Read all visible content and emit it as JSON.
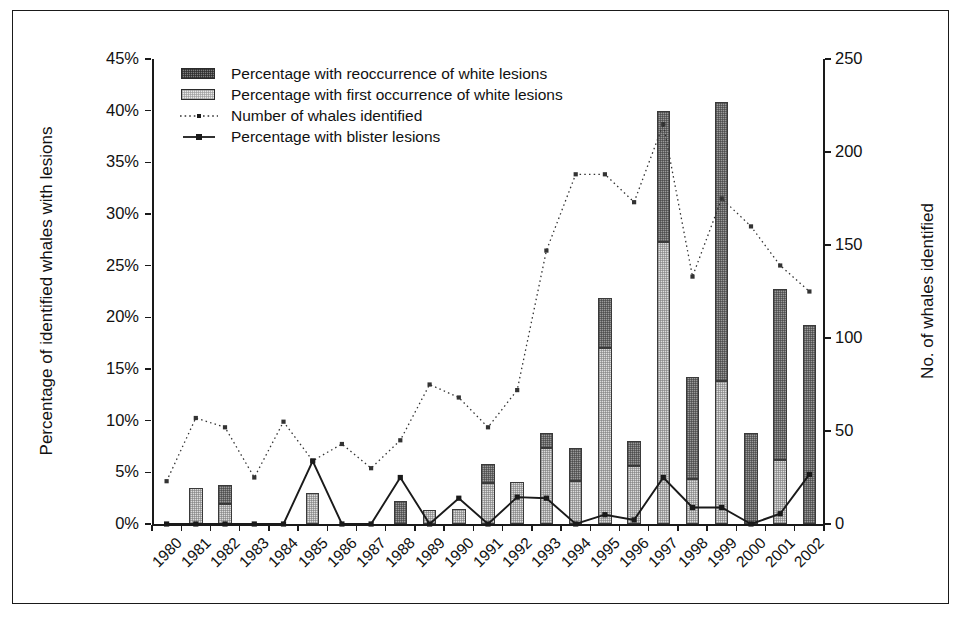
{
  "chart_data": {
    "type": "bar",
    "title": "",
    "subtitle": "",
    "xlabel": "",
    "ylabel": "Percentage of identified whales with lesions",
    "ylabel_right": "No. of whales identified",
    "ylim": [
      0,
      45
    ],
    "ylim_right": [
      0,
      250
    ],
    "ytick_labels": [
      "0%",
      "5%",
      "10%",
      "15%",
      "20%",
      "25%",
      "30%",
      "35%",
      "40%",
      "45%"
    ],
    "ytick_values": [
      0,
      5,
      10,
      15,
      20,
      25,
      30,
      35,
      40,
      45
    ],
    "ytick_labels_right": [
      "0",
      "50",
      "100",
      "150",
      "200",
      "250"
    ],
    "ytick_values_right": [
      0,
      50,
      100,
      150,
      200,
      250
    ],
    "grid": false,
    "legend_position": "top-left",
    "categories": [
      "1980",
      "1981",
      "1982",
      "1983",
      "1984",
      "1985",
      "1986",
      "1987",
      "1988",
      "1989",
      "1990",
      "1991",
      "1992",
      "1993",
      "1994",
      "1995",
      "1996",
      "1997",
      "1998",
      "1999",
      "2000",
      "2001",
      "2002"
    ],
    "series": [
      {
        "name": "Percentage with reoccurrence of white lesions",
        "type": "bar-stack",
        "axis": "left",
        "values": [
          0,
          0,
          1.9,
          0,
          0,
          0,
          0,
          0,
          2.2,
          0,
          0,
          1.8,
          0,
          1.4,
          3.2,
          4.9,
          2.4,
          12.7,
          9.8,
          27.0,
          8.8,
          16.5,
          19.3
        ]
      },
      {
        "name": "Percentage with first occurrence of white lesions",
        "type": "bar-stack",
        "axis": "left",
        "values": [
          0,
          3.5,
          1.9,
          0,
          0,
          3.0,
          0,
          0,
          0,
          1.4,
          1.5,
          4.0,
          4.1,
          7.4,
          4.2,
          17.0,
          5.6,
          27.3,
          4.4,
          13.8,
          0,
          6.2,
          0
        ]
      },
      {
        "name": "Number of whales identified",
        "type": "line-dotted",
        "axis": "right",
        "values": [
          23,
          57,
          52,
          25,
          55,
          34,
          43,
          30,
          45,
          75,
          68,
          52,
          72,
          147,
          188,
          188,
          173,
          215,
          133,
          175,
          160,
          139,
          125
        ]
      },
      {
        "name": "Percentage with blister lesions",
        "type": "line-solid",
        "axis": "left",
        "values": [
          0,
          0,
          0,
          0,
          0,
          6.1,
          0,
          0,
          4.5,
          0,
          2.5,
          0,
          2.6,
          2.5,
          0,
          0.9,
          0.4,
          4.5,
          1.6,
          1.6,
          0,
          1.0,
          4.8
        ]
      }
    ],
    "colors": {
      "reoccurrence": "#9a9a9a",
      "first_occurrence": "#dcdcdc",
      "line_whales": "#333333",
      "line_blister": "#1a1a1a",
      "axis": "#1a1a1a",
      "background": "#ffffff"
    }
  },
  "legend": {
    "items": [
      {
        "label": "Percentage with reoccurrence of white lesions",
        "key": "swatch-dark"
      },
      {
        "label": "Percentage with first occurrence of white lesions",
        "key": "swatch-light"
      },
      {
        "label": "Number of whales identified",
        "key": "dotted-line-marker"
      },
      {
        "label": "Percentage with blister lesions",
        "key": "solid-line-marker"
      }
    ]
  }
}
